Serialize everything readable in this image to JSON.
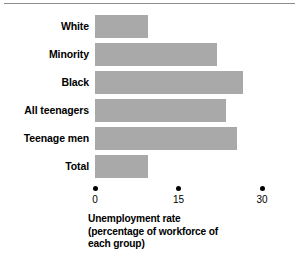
{
  "chart_data": {
    "type": "bar",
    "orientation": "horizontal",
    "title": "",
    "xlabel": "Unemployment rate (percentage of workforce of each group)",
    "ylabel": "",
    "categories": [
      "White",
      "Minority",
      "Black",
      "All teenagers",
      "Teenage men",
      "Total"
    ],
    "values": [
      9.5,
      22.0,
      26.5,
      23.5,
      25.5,
      9.5
    ],
    "xlim": [
      0,
      30
    ],
    "xticks": [
      0,
      15,
      30
    ],
    "xtick_labels": [
      "0",
      "15",
      "30"
    ],
    "grid": false,
    "legend": null,
    "bar_color": "#a9a9a9",
    "axis_tick_marker": "dot",
    "series": [
      {
        "name": "Unemployment rate",
        "values": [
          9.5,
          22.0,
          26.5,
          23.5,
          25.5,
          9.5
        ]
      }
    ]
  },
  "axis": {
    "ticks": [
      {
        "label": "0",
        "value": 0
      },
      {
        "label": "15",
        "value": 15
      },
      {
        "label": "30",
        "value": 30
      }
    ]
  },
  "rows": [
    {
      "label": "White",
      "value": 9.5
    },
    {
      "label": "Minority",
      "value": 22.0
    },
    {
      "label": "Black",
      "value": 26.5
    },
    {
      "label": "All teenagers",
      "value": 23.5
    },
    {
      "label": "Teenage men",
      "value": 25.5
    },
    {
      "label": "Total",
      "value": 9.5
    }
  ],
  "caption": {
    "line1": "Unemployment rate",
    "line2": "(percentage of workforce of",
    "line3": "each group)"
  }
}
